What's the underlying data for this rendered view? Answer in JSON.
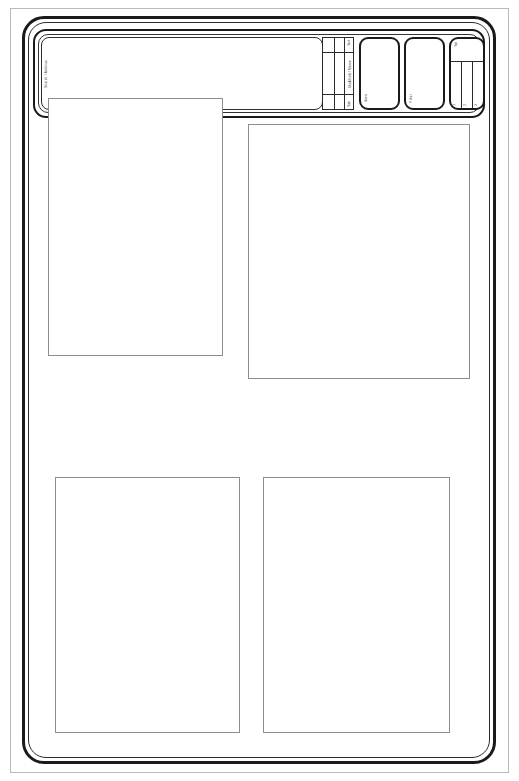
{
  "document": {
    "title": "Interface Wireframe Mockup",
    "style": "monochrome line art"
  },
  "frames": {
    "outer_label": "page-border",
    "device_label": "device-frame",
    "inner_label": "screen-frame"
  },
  "toolbar": {
    "field": {
      "side_label": "Search / Address",
      "value": "",
      "placeholder": ""
    },
    "split_cell": {
      "top_label": "Sort",
      "vertical_label": "Modified / Name",
      "bottom_label": "Size"
    },
    "cards": [
      {
        "label": "View"
      },
      {
        "label": "Filter"
      },
      {
        "label": "Columns",
        "header": "Set",
        "columns": [
          {
            "tick": "1"
          },
          {
            "tick": "2"
          },
          {
            "tick": "3"
          }
        ]
      }
    ]
  },
  "content": {
    "panels": [
      {
        "name": "top-left",
        "content": ""
      },
      {
        "name": "top-right",
        "content": ""
      },
      {
        "name": "bottom-left",
        "content": ""
      },
      {
        "name": "bottom-right",
        "content": ""
      }
    ]
  }
}
